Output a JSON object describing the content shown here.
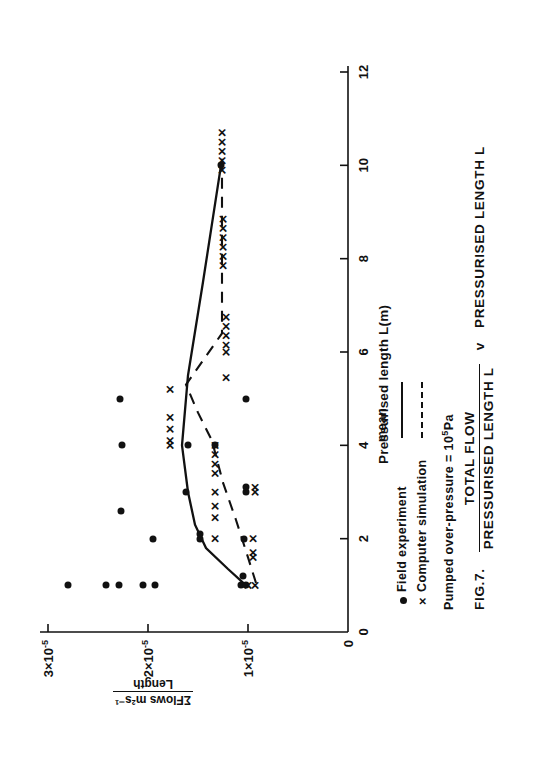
{
  "figure": {
    "fig_number": "FIG.7.",
    "caption_numerator": "TOTAL FLOW",
    "caption_denominator": "PRESSURISED LENGTH L",
    "caption_v": "v",
    "caption_tail": "PRESSURISED LENGTH L"
  },
  "axes": {
    "x_title": "Pressurised length L(m)",
    "y_title_numerator": "ΣFlows m²s⁻¹",
    "y_title_denominator": "Length",
    "x_ticks": [
      "0",
      "2",
      "4",
      "6",
      "8",
      "10",
      "12"
    ],
    "y_ticks": [
      "0",
      "1×10",
      "2×10",
      "3×10"
    ],
    "y_tick_exponent": "-5",
    "origin_label": "0"
  },
  "legend": {
    "rows": [
      {
        "marker": "●",
        "marker_kind": "dot",
        "label": "Field experiment",
        "style": "mean",
        "style_label": "mean"
      },
      {
        "marker": "×",
        "marker_kind": "cross",
        "label": "Computer simulation",
        "style": "dashed",
        "style_label": ""
      }
    ],
    "mean_header": "mean",
    "note": "Pumped over-pressure  =  10",
    "note_exponent": "5",
    "note_unit": "Pa"
  },
  "chart_data": {
    "type": "scatter",
    "xlabel": "Pressurised length L(m)",
    "ylabel": "ΣFlows m²s⁻¹ / Length",
    "xlim": [
      0,
      12
    ],
    "ylim": [
      0,
      3e-05
    ],
    "xticks": [
      0,
      2,
      4,
      6,
      8,
      10,
      12
    ],
    "yticks": [
      0,
      1e-05,
      2e-05,
      3e-05
    ],
    "grid": false,
    "legend_position": "below-axes-left",
    "annotations": [
      "Pumped over-pressure = 10^5 Pa"
    ],
    "series": [
      {
        "name": "Field experiment",
        "marker": "dot",
        "points": [
          {
            "x": 1.0,
            "y": 2.8e-05
          },
          {
            "x": 1.0,
            "y": 2.42e-05
          },
          {
            "x": 1.0,
            "y": 2.29e-05
          },
          {
            "x": 1.0,
            "y": 2.05e-05
          },
          {
            "x": 1.0,
            "y": 1.93e-05
          },
          {
            "x": 1.0,
            "y": 1.07e-05
          },
          {
            "x": 1.0,
            "y": 1.02e-05
          },
          {
            "x": 1.2,
            "y": 1.05e-05
          },
          {
            "x": 2.0,
            "y": 1.95e-05
          },
          {
            "x": 2.0,
            "y": 1.48e-05
          },
          {
            "x": 2.1,
            "y": 1.48e-05
          },
          {
            "x": 2.0,
            "y": 1.04e-05
          },
          {
            "x": 2.6,
            "y": 2.27e-05
          },
          {
            "x": 3.0,
            "y": 1.62e-05
          },
          {
            "x": 3.0,
            "y": 1.02e-05
          },
          {
            "x": 3.1,
            "y": 1.02e-05
          },
          {
            "x": 4.0,
            "y": 2.26e-05
          },
          {
            "x": 4.0,
            "y": 1.6e-05
          },
          {
            "x": 4.0,
            "y": 1.33e-05
          },
          {
            "x": 5.0,
            "y": 2.28e-05
          },
          {
            "x": 5.0,
            "y": 1.02e-05
          },
          {
            "x": 10.0,
            "y": 1.27e-05
          }
        ]
      },
      {
        "name": "Computer simulation",
        "marker": "cross",
        "points": [
          {
            "x": 1.0,
            "y": 1e-05
          },
          {
            "x": 1.0,
            "y": 9.3e-06
          },
          {
            "x": 1.6,
            "y": 9.5e-06
          },
          {
            "x": 1.7,
            "y": 9.5e-06
          },
          {
            "x": 2.0,
            "y": 9.5e-06
          },
          {
            "x": 2.0,
            "y": 1.33e-05
          },
          {
            "x": 2.45,
            "y": 1.33e-05
          },
          {
            "x": 2.7,
            "y": 1.33e-05
          },
          {
            "x": 3.0,
            "y": 1.33e-05
          },
          {
            "x": 3.0,
            "y": 9.3e-06
          },
          {
            "x": 3.1,
            "y": 9.3e-06
          },
          {
            "x": 3.4,
            "y": 1.33e-05
          },
          {
            "x": 3.6,
            "y": 1.33e-05
          },
          {
            "x": 3.8,
            "y": 1.33e-05
          },
          {
            "x": 4.0,
            "y": 1.33e-05
          },
          {
            "x": 4.0,
            "y": 1.78e-05
          },
          {
            "x": 4.1,
            "y": 1.78e-05
          },
          {
            "x": 4.35,
            "y": 1.78e-05
          },
          {
            "x": 4.6,
            "y": 1.78e-05
          },
          {
            "x": 5.2,
            "y": 1.78e-05
          },
          {
            "x": 6.0,
            "y": 1.22e-05
          },
          {
            "x": 6.15,
            "y": 1.22e-05
          },
          {
            "x": 6.35,
            "y": 1.22e-05
          },
          {
            "x": 6.55,
            "y": 1.22e-05
          },
          {
            "x": 6.75,
            "y": 1.22e-05
          },
          {
            "x": 5.45,
            "y": 1.22e-05
          },
          {
            "x": 7.85,
            "y": 1.25e-05
          },
          {
            "x": 8.05,
            "y": 1.25e-05
          },
          {
            "x": 8.25,
            "y": 1.25e-05
          },
          {
            "x": 8.45,
            "y": 1.25e-05
          },
          {
            "x": 8.65,
            "y": 1.25e-05
          },
          {
            "x": 8.85,
            "y": 1.25e-05
          },
          {
            "x": 9.9,
            "y": 1.26e-05
          },
          {
            "x": 10.1,
            "y": 1.26e-05
          },
          {
            "x": 10.3,
            "y": 1.26e-05
          },
          {
            "x": 10.5,
            "y": 1.26e-05
          },
          {
            "x": 10.7,
            "y": 1.26e-05
          }
        ]
      }
    ],
    "lines": [
      {
        "name": "Field experiment mean",
        "style": "solid",
        "points": [
          {
            "x": 1.0,
            "y": 1.02e-05
          },
          {
            "x": 1.35,
            "y": 1.2e-05
          },
          {
            "x": 1.8,
            "y": 1.42e-05
          },
          {
            "x": 2.3,
            "y": 1.53e-05
          },
          {
            "x": 3.0,
            "y": 1.6e-05
          },
          {
            "x": 4.0,
            "y": 1.66e-05
          },
          {
            "x": 5.5,
            "y": 1.6e-05
          },
          {
            "x": 7.5,
            "y": 1.45e-05
          },
          {
            "x": 10.0,
            "y": 1.27e-05
          }
        ]
      },
      {
        "name": "Computer simulation mean",
        "style": "dashed",
        "points": [
          {
            "x": 1.05,
            "y": 9.2e-06
          },
          {
            "x": 1.6,
            "y": 1e-05
          },
          {
            "x": 2.4,
            "y": 1.12e-05
          },
          {
            "x": 3.2,
            "y": 1.25e-05
          },
          {
            "x": 4.1,
            "y": 1.36e-05
          },
          {
            "x": 4.7,
            "y": 1.5e-05
          },
          {
            "x": 5.3,
            "y": 1.62e-05
          },
          {
            "x": 6.4,
            "y": 1.26e-05
          },
          {
            "x": 8.4,
            "y": 1.26e-05
          },
          {
            "x": 10.3,
            "y": 1.26e-05
          }
        ]
      }
    ]
  }
}
